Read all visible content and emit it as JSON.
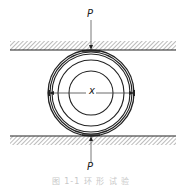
{
  "diagram": {
    "type": "ring-compression-test",
    "labels": {
      "load_top": "P",
      "load_bottom": "P",
      "diameter": "x"
    },
    "caption": "图 1-1  环 形 试 验",
    "colors": {
      "line": "#222222",
      "hatch": "#555555",
      "caption": "#c8c8c8"
    },
    "geometry": {
      "center": [
        91,
        93
      ],
      "outer_rings_r": [
        43,
        41,
        39
      ],
      "middle_ring_r": 33,
      "inner_ring_r": 22,
      "top_plate_edge_y": 50,
      "bottom_plate_edge_y": 136
    }
  }
}
